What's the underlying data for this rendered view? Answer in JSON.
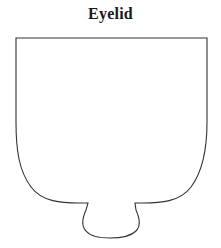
{
  "figure": {
    "title": "Eyelid",
    "title_style": "bold-serif",
    "background_color": "#ffffff",
    "stroke_color": "#333333",
    "fill_color": "#ffffff",
    "stroke_width": 1.1,
    "shape_name": "eyelid-outline",
    "shape_description": "Closed outline shape: flat horizontal top edge, straight vertical left and right sides, wide rounded U-shaped bottom, with a small rounded pendant lobe protruding at the bottom center",
    "geometry": {
      "top_edge": {
        "x1": 16,
        "y1": 38,
        "x2": 207,
        "y2": 38
      },
      "left_side_straight_to_y": 122,
      "right_side_straight_to_y": 122,
      "bottom_curve_left_junction": {
        "x": 88,
        "y": 203
      },
      "bottom_curve_right_junction": {
        "x": 135,
        "y": 203
      },
      "lobe_bottom_y": 233,
      "lobe_left_x": 88,
      "lobe_right_x": 135
    },
    "path": "M 16 38 L 207 38 L 207 122 C 207 150 203 171 191 187 C 180 202 160 203 143 203 L 135 203 L 136 210 C 140 219 141 226 136 231 C 130 237 117 238 110 238 C 103 238 91 237 86 231 C 81 226 82 219 86 210 L 88 203 L 79 203 C 62 203 42 202 31 187 C 19 171 16 150 16 122 Z"
  }
}
